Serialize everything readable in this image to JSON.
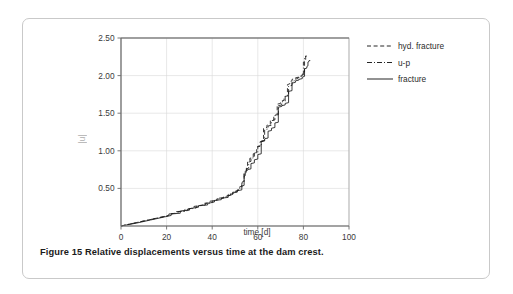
{
  "figure": {
    "caption": "Figure 15 Relative displacements versus time at the dam crest."
  },
  "chart_data": {
    "type": "line",
    "title": "",
    "xlabel": "time [d]",
    "ylabel": "|u|",
    "xlim": [
      0,
      100
    ],
    "ylim": [
      0,
      2.5
    ],
    "xticks": [
      0,
      20,
      40,
      60,
      80,
      100
    ],
    "xtick_labels": [
      "0",
      "20",
      "40",
      "60",
      "80",
      "100"
    ],
    "yticks": [
      0.5,
      1.0,
      1.5,
      2.0,
      2.5
    ],
    "ytick_labels": [
      "0.50",
      "1.00",
      "1.50",
      "2.00",
      "2.50"
    ],
    "grid": true,
    "legend_position": "outside-right-top",
    "colors": {
      "line": "#1a1a1a",
      "grid": "#d8d8d8",
      "axis": "#6b6b6b"
    },
    "series": [
      {
        "name": "hyd. fracture",
        "dash": "4,2.6",
        "x": [
          0,
          6,
          12,
          18,
          21,
          21,
          24,
          24,
          28,
          28,
          32,
          32,
          36,
          36,
          39,
          39,
          42,
          42,
          45,
          45,
          47,
          47,
          49,
          49,
          51,
          51,
          52,
          52,
          53,
          53,
          54,
          54,
          55,
          55,
          55.5,
          55.5,
          56.5,
          56.5,
          58,
          58,
          59.5,
          59.5,
          61,
          61,
          62.5,
          62.5,
          64,
          64,
          65.5,
          65.5,
          67,
          67,
          68.5,
          68.5,
          70,
          70,
          71.5,
          71.5,
          73,
          73,
          74,
          74,
          75,
          75,
          76.5,
          76.5,
          78,
          78,
          79.5,
          79.5,
          80.5,
          80.5,
          81,
          81,
          81.5
        ],
        "y": [
          0.0,
          0.04,
          0.08,
          0.12,
          0.14,
          0.16,
          0.17,
          0.19,
          0.2,
          0.22,
          0.24,
          0.26,
          0.28,
          0.3,
          0.31,
          0.33,
          0.34,
          0.36,
          0.37,
          0.39,
          0.4,
          0.42,
          0.43,
          0.45,
          0.46,
          0.48,
          0.49,
          0.52,
          0.53,
          0.58,
          0.6,
          0.7,
          0.72,
          0.78,
          0.79,
          0.86,
          0.87,
          0.9,
          0.91,
          0.96,
          0.97,
          1.05,
          1.06,
          1.12,
          1.13,
          1.3,
          1.31,
          1.34,
          1.35,
          1.4,
          1.41,
          1.47,
          1.48,
          1.62,
          1.63,
          1.66,
          1.67,
          1.72,
          1.73,
          1.88,
          1.89,
          1.92,
          1.93,
          1.95,
          1.96,
          1.97,
          1.98,
          1.99,
          2.0,
          2.02,
          2.03,
          2.2,
          2.21,
          2.26,
          2.26
        ]
      },
      {
        "name": "u-p",
        "dash": "5,2,1,2",
        "x": [
          0,
          6,
          12,
          18,
          21,
          21,
          25,
          25,
          29,
          29,
          33,
          33,
          37,
          37,
          40,
          40,
          43,
          43,
          46,
          46,
          48,
          48,
          50,
          50,
          52,
          52,
          53,
          53,
          54,
          54,
          55,
          55,
          56,
          56,
          57,
          57,
          58.5,
          58.5,
          60,
          60,
          61.5,
          61.5,
          63,
          63,
          64.5,
          64.5,
          66,
          66,
          67.5,
          67.5,
          69,
          69,
          70.5,
          70.5,
          72,
          72,
          73.5,
          73.5,
          75,
          75,
          76,
          76,
          77.5,
          77.5,
          79,
          79,
          80,
          80,
          80.5,
          80.5,
          81,
          81,
          81.5
        ],
        "y": [
          0.0,
          0.04,
          0.08,
          0.12,
          0.14,
          0.16,
          0.17,
          0.19,
          0.2,
          0.22,
          0.24,
          0.26,
          0.28,
          0.3,
          0.31,
          0.33,
          0.35,
          0.37,
          0.38,
          0.4,
          0.41,
          0.43,
          0.44,
          0.46,
          0.48,
          0.5,
          0.51,
          0.57,
          0.58,
          0.7,
          0.71,
          0.76,
          0.77,
          0.85,
          0.86,
          0.9,
          0.91,
          0.97,
          0.98,
          1.06,
          1.07,
          1.13,
          1.14,
          1.28,
          1.29,
          1.33,
          1.34,
          1.4,
          1.41,
          1.47,
          1.48,
          1.6,
          1.61,
          1.65,
          1.66,
          1.72,
          1.73,
          1.86,
          1.87,
          1.92,
          1.93,
          1.95,
          1.96,
          1.97,
          1.98,
          2.0,
          2.01,
          2.18,
          2.19,
          2.24,
          2.25,
          2.26,
          2.26
        ]
      },
      {
        "name": "fracture",
        "dash": "none",
        "x": [
          0,
          7,
          13,
          19,
          22,
          22,
          26,
          26,
          30,
          30,
          34,
          34,
          38,
          38,
          41,
          41,
          44,
          44,
          47,
          47,
          49,
          49,
          51,
          51,
          53,
          53,
          54,
          54,
          54.5,
          54.5,
          55.5,
          55.5,
          57,
          57,
          58.5,
          58.5,
          60,
          60,
          61.5,
          61.5,
          63,
          63,
          64.5,
          64.5,
          66,
          66,
          67.5,
          67.5,
          69,
          69,
          70.5,
          70.5,
          72,
          72,
          73.5,
          73.5,
          75,
          75,
          76.5,
          76.5,
          78,
          78,
          79.5,
          79.5,
          80.5,
          80.5,
          81.5,
          81.5,
          82,
          82,
          82.5,
          82.5,
          83
        ],
        "y": [
          0.0,
          0.04,
          0.08,
          0.12,
          0.14,
          0.16,
          0.17,
          0.2,
          0.21,
          0.23,
          0.25,
          0.27,
          0.28,
          0.3,
          0.32,
          0.34,
          0.35,
          0.37,
          0.38,
          0.4,
          0.42,
          0.44,
          0.45,
          0.47,
          0.48,
          0.53,
          0.54,
          0.66,
          0.67,
          0.73,
          0.74,
          0.75,
          0.76,
          0.83,
          0.84,
          0.88,
          0.89,
          0.95,
          0.96,
          1.12,
          1.13,
          1.16,
          1.17,
          1.26,
          1.27,
          1.3,
          1.31,
          1.37,
          1.38,
          1.58,
          1.59,
          1.6,
          1.61,
          1.63,
          1.64,
          1.79,
          1.8,
          1.9,
          1.91,
          1.93,
          1.94,
          1.95,
          1.96,
          1.98,
          1.99,
          2.09,
          2.1,
          2.12,
          2.13,
          2.18,
          2.19,
          2.2,
          2.2
        ]
      }
    ]
  }
}
